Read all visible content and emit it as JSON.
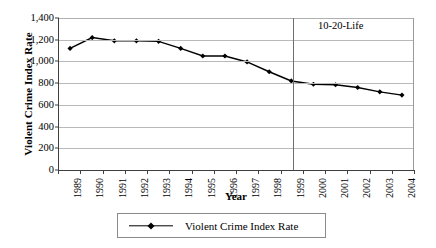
{
  "chart_data": {
    "type": "line",
    "title": "",
    "xlabel": "Year",
    "ylabel": "Violent Crime Index Rate",
    "categories": [
      "1989",
      "1990",
      "1991",
      "1992",
      "1993",
      "1994",
      "1995",
      "1996",
      "1997",
      "1998",
      "1999",
      "2000",
      "2001",
      "2002",
      "2003",
      "2004"
    ],
    "series": [
      {
        "name": "Violent Crime Index Rate",
        "values": [
          1120,
          1220,
          1190,
          1190,
          1185,
          1120,
          1050,
          1050,
          995,
          905,
          820,
          790,
          785,
          760,
          720,
          690
        ]
      }
    ],
    "ylim": [
      0,
      1400
    ],
    "yticks": [
      0,
      200,
      400,
      600,
      800,
      1000,
      1200,
      1400
    ],
    "ytick_labels": [
      "0",
      "200",
      "400",
      "600",
      "800",
      "1,000",
      "1,200",
      "1,400"
    ],
    "grid": true,
    "legend_position": "bottom",
    "series_color": "#000000",
    "gridline_color": "#b9b9b9",
    "annotations": [
      {
        "text": "10-20-Life",
        "at_category": "1999",
        "type": "vertical-line-label"
      }
    ]
  },
  "legend": {
    "entries": [
      {
        "label": "Violent Crime Index Rate"
      }
    ]
  }
}
